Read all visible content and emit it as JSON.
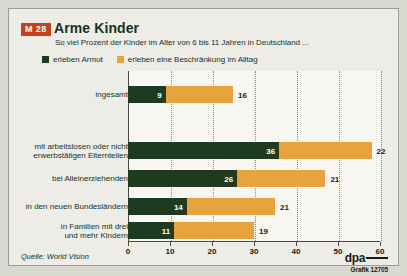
{
  "badge": "M 28",
  "title": "Arme Kinder",
  "subtitle": "So viel Prozent der Kinder im Alter von 6 bis 11 Jahren in Deutschland ...",
  "legend": [
    {
      "label": "erleben Armut",
      "color": "#1e3b22"
    },
    {
      "label": "erleben eine Beschränkung im Alltag",
      "color": "#e8a33d"
    }
  ],
  "source": "Quelle: World Vision",
  "credit": {
    "agency": "dpa",
    "graphic": "Grafik 12705"
  },
  "chart_data": {
    "type": "bar",
    "orientation": "horizontal",
    "stacked": true,
    "title": "Arme Kinder",
    "subtitle": "So viel Prozent der Kinder im Alter von 6 bis 11 Jahren in Deutschland ...",
    "xlabel": "",
    "ylabel": "",
    "xlim": [
      0,
      60
    ],
    "xticks": [
      0,
      10,
      20,
      30,
      40,
      50,
      60
    ],
    "grid": true,
    "legend_position": "top-left",
    "categories": [
      "ingesamt",
      "mit arbeitslosen oder nicht erwerbstätigen Elternteilen",
      "bei Alleinerziehenden",
      "in den neuen Bundesländern",
      "in Familien mit drei und mehr Kindern"
    ],
    "category_lines": [
      [
        "ingesamt"
      ],
      [
        "mit arbeitslosen oder nicht",
        "erwerbstätigen Elternteilen"
      ],
      [
        "bei Alleinerziehenden"
      ],
      [
        "in den neuen Bundesländern"
      ],
      [
        "in Familien mit drei",
        "und mehr Kindern"
      ]
    ],
    "series": [
      {
        "name": "erleben Armut",
        "color": "#1e3b22",
        "values": [
          9,
          36,
          26,
          14,
          11
        ]
      },
      {
        "name": "erleben eine Beschränkung im Alltag",
        "color": "#e8a33d",
        "values": [
          16,
          22,
          21,
          21,
          19
        ]
      }
    ]
  }
}
